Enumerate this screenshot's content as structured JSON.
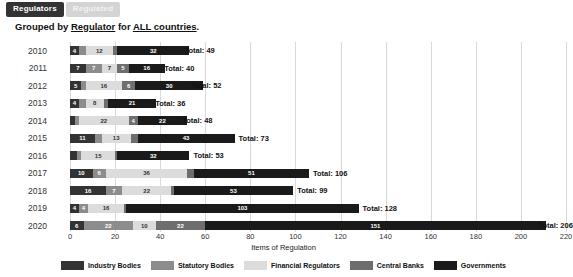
{
  "tabs": [
    {
      "label": "Regulators",
      "active": true
    },
    {
      "label": "Regulated",
      "active": false
    }
  ],
  "title": {
    "prefix": "Grouped by ",
    "group_by": "Regulator",
    "middle": " for ",
    "scope": "ALL countries",
    "suffix": "."
  },
  "total_prefix": "Total: ",
  "chart_data": {
    "type": "bar",
    "orientation": "horizontal",
    "stacked": true,
    "title": "Grouped by Regulator for ALL countries.",
    "xlabel": "Items of Regulation",
    "ylabel": "",
    "xlim": [
      0,
      220
    ],
    "xticks": [
      0,
      20,
      40,
      60,
      80,
      100,
      120,
      140,
      160,
      180,
      200,
      220
    ],
    "grid": true,
    "legend_position": "bottom",
    "categories": [
      "2010",
      "2011",
      "2012",
      "2013",
      "2014",
      "2015",
      "2016",
      "2017",
      "2018",
      "2019",
      "2020"
    ],
    "series": [
      {
        "name": "Industry Bodies",
        "color": "#333333",
        "values": [
          4,
          7,
          5,
          4,
          2,
          11,
          3,
          10,
          16,
          4,
          6
        ]
      },
      {
        "name": "Statutory Bodies",
        "color": "#8c8c8c",
        "values": [
          3,
          7,
          2,
          3,
          2,
          3,
          2,
          6,
          7,
          4,
          22
        ]
      },
      {
        "name": "Financial Regulators",
        "color": "#dcdcdc",
        "values": [
          12,
          7,
          16,
          8,
          22,
          13,
          15,
          36,
          22,
          16,
          10
        ]
      },
      {
        "name": "Central Banks",
        "color": "#6e6e6e",
        "values": [
          2,
          5,
          6,
          2,
          4,
          3,
          1,
          3,
          1,
          1,
          22
        ]
      },
      {
        "name": "Governments",
        "color": "#1a1a1a",
        "values": [
          32,
          16,
          30,
          21,
          22,
          43,
          32,
          51,
          53,
          103,
          151
        ]
      }
    ],
    "totals": [
      49,
      40,
      52,
      36,
      48,
      73,
      53,
      106,
      99,
      128,
      206
    ]
  }
}
